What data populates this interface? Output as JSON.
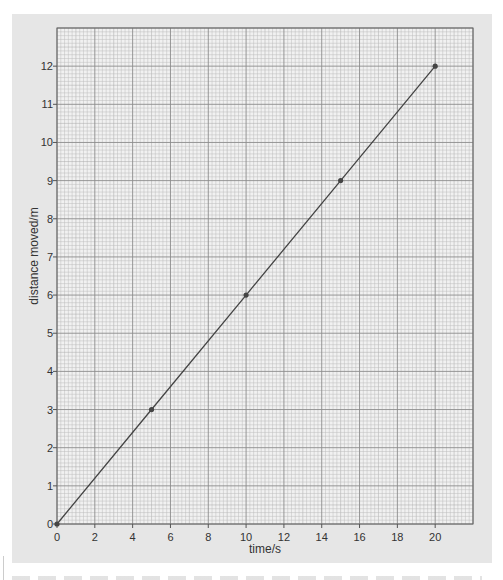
{
  "chart_data": {
    "type": "line",
    "title": "",
    "xlabel": "time/s",
    "ylabel": "distance moved/m",
    "xlim": [
      0,
      22
    ],
    "ylim": [
      0,
      13
    ],
    "x_ticks": [
      0,
      2,
      4,
      6,
      8,
      10,
      12,
      14,
      16,
      18,
      20
    ],
    "y_ticks": [
      0,
      1,
      2,
      3,
      4,
      5,
      6,
      7,
      8,
      9,
      10,
      11,
      12
    ],
    "x_tick_labels": [
      "0",
      "2",
      "4",
      "6",
      "8",
      "10",
      "12",
      "14",
      "16",
      "18",
      "20"
    ],
    "y_tick_labels": [
      "0",
      "1",
      "2",
      "3",
      "4",
      "5",
      "6",
      "7",
      "8",
      "9",
      "10",
      "11",
      "12"
    ],
    "grid": "graph-paper (major every 2 s / 1 m, minor subdivisions)",
    "legend": "none",
    "series": [
      {
        "name": "distance vs time",
        "x": [
          0,
          5,
          10,
          15,
          20
        ],
        "y": [
          0,
          3,
          6,
          9,
          12
        ],
        "color": "#444444",
        "markers": true
      }
    ]
  },
  "colors": {
    "panel": "#e6e6e6",
    "grid_minor": "#bcbcbc",
    "grid_major": "#8c8c8c",
    "line": "#444444",
    "text": "#333333"
  }
}
